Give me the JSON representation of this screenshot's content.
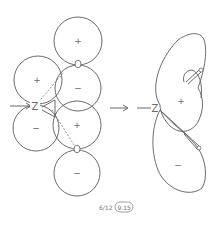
{
  "diagram": {
    "left": {
      "lobes": [
        {
          "sign": "+",
          "label": "upper-oxygen-top-lobe"
        },
        {
          "sign": "−",
          "label": "upper-oxygen-bottom-lobe"
        },
        {
          "sign": "+",
          "label": "z-upper-lobe"
        },
        {
          "sign": "−",
          "label": "z-lower-lobe"
        },
        {
          "sign": "+",
          "label": "lower-oxygen-top-lobe"
        },
        {
          "sign": "−",
          "label": "lower-oxygen-bottom-lobe"
        }
      ],
      "atoms": {
        "z": "Z",
        "o1": "O",
        "o2": "O"
      }
    },
    "middle_arrow": "→",
    "right": {
      "z": "Z",
      "upper_sign": "+",
      "lower_sign": "−"
    },
    "caption": {
      "date": "6/12",
      "figure": "9.15"
    }
  }
}
